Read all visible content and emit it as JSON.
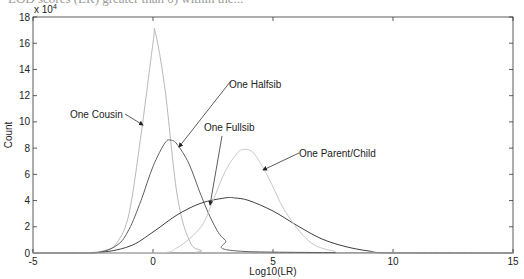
{
  "header": {
    "clipped_caption": "LOD scores (LR) greater than 0) within the..."
  },
  "chart_data": {
    "type": "line",
    "title": "",
    "xlabel": "Log10(LR)",
    "ylabel": "Count",
    "y_scale_label": "x 10",
    "y_scale_exponent": "4",
    "xlim": [
      -5,
      15
    ],
    "ylim": [
      0,
      18
    ],
    "x_ticks": [
      -5,
      0,
      5,
      10,
      15
    ],
    "y_ticks": [
      0,
      2,
      4,
      6,
      8,
      10,
      12,
      14,
      16,
      18
    ],
    "grid": false,
    "legend": "none (inline arrow annotations)",
    "units_note": "y values in units of 10^4",
    "series": [
      {
        "name": "One Cousin",
        "color": "#b8b8b8",
        "x": [
          -3,
          -2,
          -1.5,
          -1,
          -0.5,
          0,
          0.1,
          0.5,
          1,
          1.5,
          2,
          3
        ],
        "values": [
          0,
          0.2,
          0.8,
          3.0,
          9.0,
          16.0,
          16.8,
          12.5,
          4.5,
          1.0,
          0.2,
          0
        ]
      },
      {
        "name": "One Halfsib",
        "color": "#606060",
        "x": [
          -2.5,
          -1.5,
          -1,
          -0.5,
          0,
          0.5,
          0.75,
          1,
          1.5,
          2,
          2.5,
          3,
          4
        ],
        "values": [
          0,
          0.6,
          1.8,
          4.0,
          6.6,
          8.4,
          8.6,
          8.3,
          6.8,
          4.4,
          2.3,
          1.0,
          0.1
        ]
      },
      {
        "name": "One Fullsib",
        "color": "#404040",
        "x": [
          -2.5,
          -1,
          0,
          1,
          2,
          3,
          3.4,
          4,
          5,
          6,
          7,
          8,
          9,
          10
        ],
        "values": [
          0,
          0.5,
          1.6,
          2.9,
          3.8,
          4.2,
          4.2,
          4.0,
          3.2,
          2.1,
          1.1,
          0.5,
          0.15,
          0
        ]
      },
      {
        "name": "One Parent/Child",
        "color": "#c8c8c8",
        "x": [
          0,
          1,
          2,
          2.5,
          3,
          3.5,
          3.8,
          4.2,
          4.8,
          5.5,
          6.5,
          7.5,
          8.5
        ],
        "values": [
          0,
          0.4,
          2.0,
          4.0,
          6.2,
          7.6,
          7.9,
          7.6,
          5.8,
          3.2,
          0.9,
          0.15,
          0
        ]
      }
    ],
    "annotations": [
      {
        "text": "One Cousin",
        "points_to_series": "One Cousin"
      },
      {
        "text": "One Halfsib",
        "points_to_series": "One Halfsib"
      },
      {
        "text": "One Fullsib",
        "points_to_series": "One Fullsib"
      },
      {
        "text": "One Parent/Child",
        "points_to_series": "One Parent/Child"
      }
    ]
  }
}
